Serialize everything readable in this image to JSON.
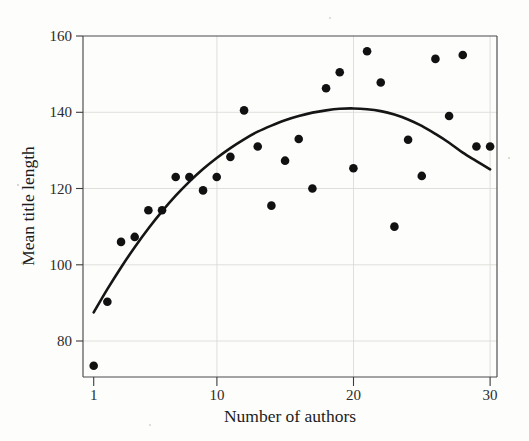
{
  "figure": {
    "background_color": "#fdfdfc",
    "point_color": "#111111",
    "curve_color": "#151515",
    "grid_color": "#d9d9d4",
    "frame_color": "#4a4a4a"
  },
  "axes": {
    "x_title": "Number of authors",
    "y_title": "Mean title length",
    "x_ticks": [
      "1",
      "10",
      "20",
      "30"
    ],
    "y_ticks": [
      "160",
      "140",
      "120",
      "100",
      "80"
    ]
  },
  "chart_data": {
    "type": "scatter",
    "title": "",
    "xlabel": "Number of authors",
    "ylabel": "Mean title length",
    "xlim": [
      0.1,
      30.5
    ],
    "ylim": [
      70,
      162
    ],
    "xticks": [
      1,
      10,
      20,
      30
    ],
    "yticks": [
      80,
      100,
      120,
      140,
      160
    ],
    "grid": true,
    "legend": "none",
    "points": [
      {
        "x": 1,
        "y": 73.5
      },
      {
        "x": 2,
        "y": 90.3
      },
      {
        "x": 3,
        "y": 106.0
      },
      {
        "x": 4,
        "y": 107.3
      },
      {
        "x": 5,
        "y": 114.3
      },
      {
        "x": 6,
        "y": 114.3
      },
      {
        "x": 7,
        "y": 123.0
      },
      {
        "x": 8,
        "y": 123.0
      },
      {
        "x": 9,
        "y": 119.5
      },
      {
        "x": 10,
        "y": 123.0
      },
      {
        "x": 11,
        "y": 128.3
      },
      {
        "x": 12,
        "y": 140.5
      },
      {
        "x": 13,
        "y": 131.0
      },
      {
        "x": 14,
        "y": 115.5
      },
      {
        "x": 15,
        "y": 127.3
      },
      {
        "x": 16,
        "y": 133.0
      },
      {
        "x": 17,
        "y": 120.0
      },
      {
        "x": 18,
        "y": 146.3
      },
      {
        "x": 19,
        "y": 150.5
      },
      {
        "x": 20,
        "y": 125.3
      },
      {
        "x": 21,
        "y": 156.0
      },
      {
        "x": 22,
        "y": 147.8
      },
      {
        "x": 23,
        "y": 110.0
      },
      {
        "x": 24,
        "y": 132.8
      },
      {
        "x": 25,
        "y": 123.3
      },
      {
        "x": 26,
        "y": 154.0
      },
      {
        "x": 27,
        "y": 139.0
      },
      {
        "x": 28,
        "y": 155.0
      },
      {
        "x": 29,
        "y": 131.0
      },
      {
        "x": 30,
        "y": 131.0
      }
    ],
    "fit_curve": {
      "kind": "quadratic",
      "description": "smooth concave fit peaking near x=20 at y=141",
      "sampled": [
        {
          "x": 1.0,
          "y": 87.5
        },
        {
          "x": 2.0,
          "y": 93.6
        },
        {
          "x": 3.0,
          "y": 99.3
        },
        {
          "x": 4.0,
          "y": 104.6
        },
        {
          "x": 5.0,
          "y": 109.5
        },
        {
          "x": 6.0,
          "y": 114.0
        },
        {
          "x": 7.0,
          "y": 118.1
        },
        {
          "x": 8.0,
          "y": 121.8
        },
        {
          "x": 9.0,
          "y": 125.1
        },
        {
          "x": 10.0,
          "y": 128.0
        },
        {
          "x": 11.0,
          "y": 130.6
        },
        {
          "x": 12.0,
          "y": 132.9
        },
        {
          "x": 13.0,
          "y": 134.9
        },
        {
          "x": 14.0,
          "y": 136.5
        },
        {
          "x": 15.0,
          "y": 137.9
        },
        {
          "x": 16.0,
          "y": 139.0
        },
        {
          "x": 17.0,
          "y": 139.9
        },
        {
          "x": 18.0,
          "y": 140.5
        },
        {
          "x": 19.0,
          "y": 140.9
        },
        {
          "x": 20.0,
          "y": 141.0
        },
        {
          "x": 21.0,
          "y": 140.8
        },
        {
          "x": 22.0,
          "y": 140.3
        },
        {
          "x": 23.0,
          "y": 139.4
        },
        {
          "x": 24.0,
          "y": 138.1
        },
        {
          "x": 25.0,
          "y": 136.4
        },
        {
          "x": 26.0,
          "y": 134.3
        },
        {
          "x": 27.0,
          "y": 132.0
        },
        {
          "x": 28.0,
          "y": 129.4
        },
        {
          "x": 29.0,
          "y": 127.2
        },
        {
          "x": 30.0,
          "y": 125.0
        }
      ]
    }
  }
}
